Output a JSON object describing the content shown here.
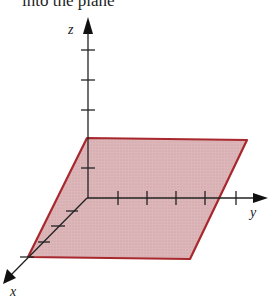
{
  "caption": {
    "text": "into the plane"
  },
  "diagram": {
    "type": "3d-coordinate-axes-with-plane",
    "axes": {
      "x": {
        "label": "x",
        "tick_count": 4
      },
      "y": {
        "label": "y",
        "tick_count": 5
      },
      "z": {
        "label": "z",
        "tick_count": 5
      }
    },
    "plane": {
      "description": "horizontal plane through z = 2 tick mark, parallel to the xy-plane",
      "fill_color": "#d9b0b2",
      "edge_color": "#a8282d"
    },
    "axis_color": "#222222"
  }
}
